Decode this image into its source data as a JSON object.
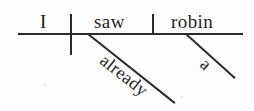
{
  "diagram": {
    "type": "reed-kellogg-sentence-diagram",
    "sentence": "I saw a robin already.",
    "baseline": {
      "label": "main-baseline",
      "x1": 18,
      "y1": 34,
      "x2": 243,
      "y2": 34
    },
    "dividers": [
      {
        "name": "subject-verb-divider",
        "crosses_baseline": true,
        "x": 71,
        "y_top": 14,
        "y_bottom": 55
      },
      {
        "name": "verb-object-divider",
        "crosses_baseline": false,
        "x": 153,
        "y_top": 14,
        "y_bottom": 34
      }
    ],
    "words": [
      {
        "text": "I",
        "role": "subject",
        "x": 47,
        "y": 22
      },
      {
        "text": "saw",
        "role": "verb",
        "x": 115,
        "y": 22
      },
      {
        "text": "robin",
        "role": "direct-object",
        "x": 197,
        "y": 22
      }
    ],
    "modifiers": [
      {
        "text": "already",
        "role": "adverb",
        "modifies": "saw",
        "angle_deg": 38.5,
        "x1": 88,
        "y1": 34,
        "x2": 175,
        "y2": 103
      },
      {
        "text": "a",
        "role": "article",
        "modifies": "robin",
        "angle_deg": 42,
        "x1": 186,
        "y1": 34,
        "x2": 235,
        "y2": 78
      }
    ],
    "colors": {
      "ink": "#2b2b2b",
      "text": "#1f1f1f",
      "background": "#fefefe"
    }
  }
}
